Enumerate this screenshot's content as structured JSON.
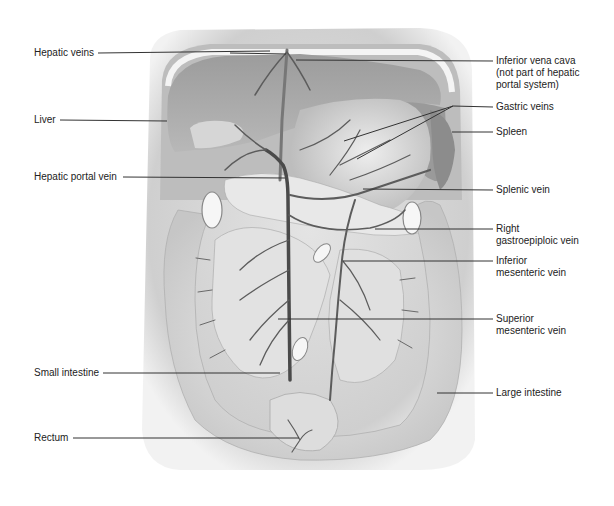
{
  "title": "Hepatic portal system",
  "labels": {
    "left": [
      {
        "id": "hepatic-veins",
        "text": "Hepatic veins"
      },
      {
        "id": "liver",
        "text": "Liver"
      },
      {
        "id": "hepatic-portal-vein",
        "text": "Hepatic portal vein"
      },
      {
        "id": "small-intestine",
        "text": "Small intestine"
      },
      {
        "id": "rectum",
        "text": "Rectum"
      }
    ],
    "right": [
      {
        "id": "inferior-vena-cava",
        "lines": [
          "Inferior vena cava",
          "(not part of hepatic",
          "portal system)"
        ]
      },
      {
        "id": "gastric-veins",
        "lines": [
          "Gastric veins"
        ]
      },
      {
        "id": "spleen",
        "lines": [
          "Spleen"
        ]
      },
      {
        "id": "splenic-vein",
        "lines": [
          "Splenic vein"
        ]
      },
      {
        "id": "right-gastroepiploic-vein",
        "lines": [
          "Right",
          "gastroepiploic vein"
        ]
      },
      {
        "id": "inferior-mesenteric-vein",
        "lines": [
          "Inferior",
          "mesenteric vein"
        ]
      },
      {
        "id": "superior-mesenteric-vein",
        "lines": [
          "Superior",
          "mesenteric vein"
        ]
      },
      {
        "id": "large-intestine",
        "lines": [
          "Large intestine"
        ]
      }
    ]
  },
  "colors": {
    "text": "#222222",
    "leader": "#333333",
    "organ_dark": "#8a8a8a",
    "organ_mid": "#b4b4b4",
    "organ_light": "#dcdcdc",
    "vein": "#5c5c5c",
    "background": "#ffffff"
  }
}
